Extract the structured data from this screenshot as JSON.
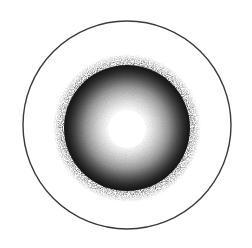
{
  "figure": {
    "background_color": "#ffffff"
  },
  "canvas": {
    "width": 252,
    "height": 248
  },
  "outer_circle": {
    "name": "outer-ring",
    "center_x": 127,
    "center_y": 125,
    "radius": 104,
    "stroke_color": "#3a3a3a",
    "stroke_width": 1.4,
    "fill": "none"
  },
  "inner_disk": {
    "name": "inner-disk",
    "center_x": 127,
    "center_y": 128,
    "solid_radius": 63,
    "stipple_outer_radius": 73,
    "core_radius": 20,
    "core_color": "#ffffff",
    "rim_color": "#1a1a1a",
    "gradient_stops": [
      {
        "offset": "0%",
        "color": "#ffffff"
      },
      {
        "offset": "24%",
        "color": "#ffffff"
      },
      {
        "offset": "36%",
        "color": "#ededed"
      },
      {
        "offset": "50%",
        "color": "#c9c9c9"
      },
      {
        "offset": "64%",
        "color": "#9a9a9a"
      },
      {
        "offset": "78%",
        "color": "#5e5e5e"
      },
      {
        "offset": "90%",
        "color": "#2a2a2a"
      },
      {
        "offset": "100%",
        "color": "#161616"
      }
    ]
  },
  "stipple": {
    "name": "stipple-fringe",
    "color": "#1a1a1a",
    "inner_radius": 60,
    "outer_radius": 74,
    "density": "high-at-inner-edge"
  },
  "labels": {
    "visible_text": []
  }
}
